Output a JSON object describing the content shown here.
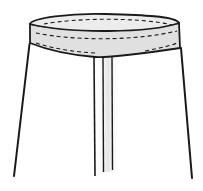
{
  "illustration": {
    "subject": "skirt-waistband-line-drawing",
    "colors": {
      "background": "#ffffff",
      "stroke": "#1a1a1a",
      "waistband_fill": "#e2e2e2",
      "waistband_inner_fill": "#ececec",
      "shade": "#d8d8d8"
    },
    "elements": {
      "waistband": "waistband with topstitching",
      "skirt_body": "a-line skirt body",
      "center_pleat": "center front pleat lines"
    }
  }
}
